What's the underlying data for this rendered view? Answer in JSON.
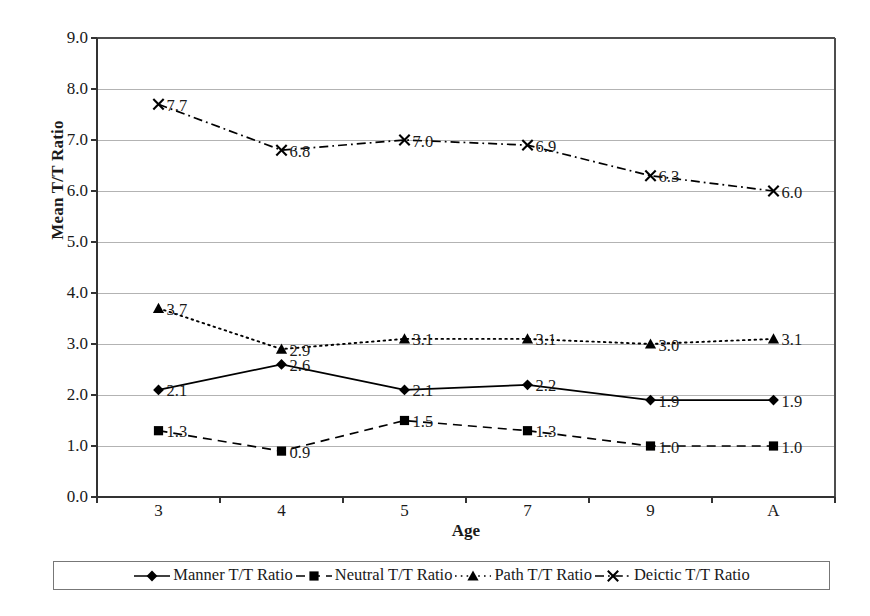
{
  "chart_data": {
    "type": "line",
    "title": "",
    "xlabel": "Age",
    "ylabel": "Mean T/T Ratio",
    "categories": [
      "3",
      "4",
      "5",
      "7",
      "9",
      "A"
    ],
    "ylim": [
      0.0,
      9.0
    ],
    "ytick_step": 1.0,
    "yticks": [
      "9.0",
      "8.0",
      "7.0",
      "6.0",
      "5.0",
      "4.0",
      "3.0",
      "2.0",
      "1.0",
      "0.0"
    ],
    "grid": "horizontal",
    "legend_position": "bottom",
    "show_data_labels": true,
    "series": [
      {
        "name": "Manner T/T Ratio",
        "marker": "diamond",
        "dash": "solid",
        "color": "#000000",
        "values": [
          2.1,
          2.6,
          2.1,
          2.2,
          1.9,
          1.9
        ],
        "labels": [
          "2.1",
          "2.6",
          "2.1",
          "2.2",
          "1.9",
          "1.9"
        ]
      },
      {
        "name": "Neutral T/T Ratio",
        "marker": "square",
        "dash": "dashed",
        "color": "#000000",
        "values": [
          1.3,
          0.9,
          1.5,
          1.3,
          1.0,
          1.0
        ],
        "labels": [
          "1.3",
          "0.9",
          "1.5",
          "1.3",
          "1.0",
          "1.0"
        ]
      },
      {
        "name": "Path T/T Ratio",
        "marker": "triangle",
        "dash": "dotted",
        "color": "#000000",
        "values": [
          3.7,
          2.9,
          3.1,
          3.1,
          3.0,
          3.1
        ],
        "labels": [
          "3.7",
          "2.9",
          "3.1",
          "3.1",
          "3.0",
          "3.1"
        ]
      },
      {
        "name": "Deictic T/T Ratio",
        "marker": "cross",
        "dash": "dashdot",
        "color": "#000000",
        "values": [
          7.7,
          6.8,
          7.0,
          6.9,
          6.3,
          6.0
        ],
        "labels": [
          "7.7",
          "6.8",
          "7.0",
          "6.9",
          "6.3",
          "6.0"
        ]
      }
    ]
  },
  "axes": {
    "y_title": "Mean T/T Ratio",
    "x_title": "Age"
  },
  "colors": {
    "ink": "#1a1a1a",
    "axis": "#4d4d4d",
    "grid": "#b3b3b3",
    "legend_border": "#777777"
  }
}
